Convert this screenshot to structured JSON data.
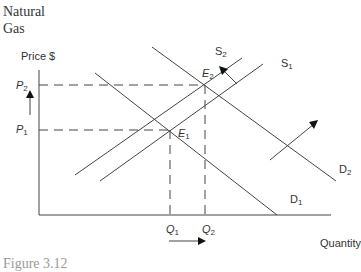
{
  "title_line1": "Natural",
  "title_line2": "Gas",
  "axes": {
    "y_label": "Price $",
    "x_label": "Quantity"
  },
  "price_labels": [
    {
      "base": "P",
      "sub": "2"
    },
    {
      "base": "P",
      "sub": "1"
    }
  ],
  "quantity_labels": [
    {
      "base": "Q",
      "sub": "1"
    },
    {
      "base": "Q",
      "sub": "2"
    }
  ],
  "equilibria": [
    {
      "base": "E",
      "sub": "1"
    },
    {
      "base": "E",
      "sub": "2"
    }
  ],
  "curves": {
    "supply": [
      {
        "base": "S",
        "sub": "1"
      },
      {
        "base": "S",
        "sub": "2"
      }
    ],
    "demand": [
      {
        "base": "D",
        "sub": "1"
      },
      {
        "base": "D",
        "sub": "2"
      }
    ]
  },
  "caption": "Figure 3.12",
  "colors": {
    "line": "#444444",
    "text": "#333333"
  }
}
